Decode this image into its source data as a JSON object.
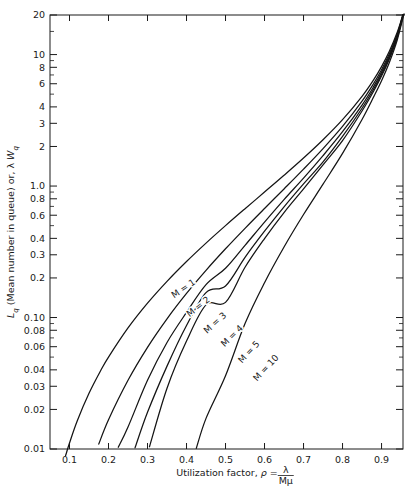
{
  "chart_data": {
    "type": "line",
    "title": "",
    "xlabel": "Utilization factor, ρ = λ/Mμ",
    "ylabel": "Lq (Mean number in queue) or, λ Wq",
    "xscale": "linear",
    "yscale": "log",
    "xlim": [
      0.05,
      0.955
    ],
    "ylim": [
      0.01,
      20
    ],
    "grid": false,
    "legend_position": "inline-curve-labels",
    "x_ticks": [
      0.1,
      0.2,
      0.3,
      0.4,
      0.5,
      0.6,
      0.7,
      0.8,
      0.9
    ],
    "x_tick_labels": [
      "0.1",
      "0.2",
      "0.3",
      "0.4",
      "0.5",
      "0.6",
      "0.7",
      "0.8",
      "0.9"
    ],
    "y_ticks": [
      0.01,
      0.02,
      0.03,
      0.04,
      0.06,
      0.08,
      0.1,
      0.2,
      0.3,
      0.4,
      0.6,
      0.8,
      1.0,
      2,
      3,
      4,
      6,
      8,
      10,
      20
    ],
    "y_tick_labels": [
      "0.01",
      "0.02",
      "0.03",
      "0.04",
      "0.06",
      "0.08",
      "0.10",
      "0.2",
      "0.3",
      "0.4",
      "0.6",
      "0.8",
      "1.0",
      "2",
      "3",
      "4",
      "6",
      "8",
      "10",
      "20"
    ],
    "series": [
      {
        "name": "M = 1",
        "label": "M = 1",
        "M": 1,
        "points": [
          [
            0.09,
            0.0089
          ],
          [
            0.1,
            0.0111
          ],
          [
            0.12,
            0.0164
          ],
          [
            0.15,
            0.0265
          ],
          [
            0.18,
            0.0395
          ],
          [
            0.2,
            0.05
          ],
          [
            0.25,
            0.0833
          ],
          [
            0.3,
            0.1286
          ],
          [
            0.35,
            0.1885
          ],
          [
            0.4,
            0.2667
          ],
          [
            0.45,
            0.3682
          ],
          [
            0.5,
            0.5
          ],
          [
            0.55,
            0.6722
          ],
          [
            0.6,
            0.9
          ],
          [
            0.65,
            1.2071
          ],
          [
            0.7,
            1.6333
          ],
          [
            0.75,
            2.25
          ],
          [
            0.8,
            3.2
          ],
          [
            0.85,
            4.8167
          ],
          [
            0.88,
            6.4533
          ],
          [
            0.9,
            8.1
          ],
          [
            0.92,
            10.58
          ],
          [
            0.94,
            14.72
          ],
          [
            0.9524,
            19.05
          ],
          [
            0.9545,
            20.0
          ]
        ]
      },
      {
        "name": "M = 2",
        "label": "M = 2",
        "M": 2,
        "points": [
          [
            0.175,
            0.0109
          ],
          [
            0.2,
            0.0167
          ],
          [
            0.25,
            0.0333
          ],
          [
            0.3,
            0.0593
          ],
          [
            0.35,
            0.0977
          ],
          [
            0.4,
            0.1524
          ],
          [
            0.45,
            0.2285
          ],
          [
            0.5,
            0.3333
          ],
          [
            0.55,
            0.4771
          ],
          [
            0.6,
            0.675
          ],
          [
            0.65,
            0.9506
          ],
          [
            0.7,
            1.3451
          ],
          [
            0.75,
            1.9286
          ],
          [
            0.8,
            2.8444
          ],
          [
            0.85,
            4.4262
          ],
          [
            0.88,
            6.0466
          ],
          [
            0.9,
            7.6737
          ],
          [
            0.92,
            10.13
          ],
          [
            0.94,
            14.25
          ],
          [
            0.952,
            18.61
          ],
          [
            0.9545,
            20.0
          ]
        ]
      },
      {
        "name": "M = 3",
        "label": "M = 3",
        "M": 3,
        "points": [
          [
            0.225,
            0.0103
          ],
          [
            0.25,
            0.0147
          ],
          [
            0.3,
            0.0333
          ],
          [
            0.35,
            0.0646
          ],
          [
            0.4,
            0.1094
          ],
          [
            0.45,
            0.1778
          ],
          [
            0.5,
            0.2368
          ],
          [
            0.55,
            0.3541
          ],
          [
            0.6,
            0.532
          ],
          [
            0.65,
            0.7888
          ],
          [
            0.7,
            1.1479
          ],
          [
            0.75,
            1.7036
          ],
          [
            0.8,
            2.5888
          ],
          [
            0.85,
            4.1332
          ],
          [
            0.88,
            5.7238
          ],
          [
            0.9,
            7.3541
          ],
          [
            0.92,
            9.7895
          ],
          [
            0.94,
            13.89
          ],
          [
            0.953,
            19.15
          ],
          [
            0.9555,
            20.0
          ]
        ]
      },
      {
        "name": "M = 4",
        "label": "M = 4",
        "M": 4,
        "points": [
          [
            0.268,
            0.0102
          ],
          [
            0.3,
            0.019
          ],
          [
            0.35,
            0.0427
          ],
          [
            0.4,
            0.087
          ],
          [
            0.45,
            0.1548
          ],
          [
            0.5,
            0.1739
          ],
          [
            0.55,
            0.287
          ],
          [
            0.6,
            0.4533
          ],
          [
            0.65,
            0.6954
          ],
          [
            0.7,
            1.0393
          ],
          [
            0.75,
            1.5281
          ],
          [
            0.8,
            2.3856
          ],
          [
            0.85,
            3.9076
          ],
          [
            0.88,
            5.4867
          ],
          [
            0.9,
            7.0898
          ],
          [
            0.92,
            9.5044
          ],
          [
            0.94,
            13.6
          ],
          [
            0.954,
            19.35
          ],
          [
            0.9565,
            20.0
          ]
        ]
      },
      {
        "name": "M = 5",
        "label": "M = 5",
        "M": 5,
        "points": [
          [
            0.305,
            0.0104
          ],
          [
            0.35,
            0.029
          ],
          [
            0.4,
            0.0662
          ],
          [
            0.45,
            0.1249
          ],
          [
            0.5,
            0.1304
          ],
          [
            0.55,
            0.2411
          ],
          [
            0.6,
            0.3988
          ],
          [
            0.65,
            0.6287
          ],
          [
            0.7,
            0.9506
          ],
          [
            0.75,
            1.4488
          ],
          [
            0.8,
            2.2164
          ],
          [
            0.85,
            3.7212
          ],
          [
            0.88,
            5.2875
          ],
          [
            0.9,
            6.8624
          ],
          [
            0.92,
            9.2555
          ],
          [
            0.94,
            13.38
          ],
          [
            0.955,
            19.53
          ],
          [
            0.957,
            20.0
          ]
        ]
      },
      {
        "name": "M = 10",
        "label": "M = 10",
        "M": 10,
        "points": [
          [
            0.425,
            0.0101
          ],
          [
            0.45,
            0.0171
          ],
          [
            0.5,
            0.0361
          ],
          [
            0.55,
            0.09
          ],
          [
            0.6,
            0.1841
          ],
          [
            0.65,
            0.344
          ],
          [
            0.7,
            0.6075
          ],
          [
            0.75,
            1.0335
          ],
          [
            0.8,
            1.7705
          ],
          [
            0.85,
            3.2117
          ],
          [
            0.88,
            4.7876
          ],
          [
            0.9,
            6.3315
          ],
          [
            0.92,
            8.7095
          ],
          [
            0.94,
            12.85
          ],
          [
            0.956,
            19.62
          ],
          [
            0.958,
            20.0
          ]
        ]
      }
    ],
    "curve_labels": [
      {
        "text": "M = 1",
        "x": 185,
        "y": 291,
        "rot": -34
      },
      {
        "text": "M = 2",
        "x": 200,
        "y": 309,
        "rot": -38
      },
      {
        "text": "M = 3",
        "x": 217,
        "y": 325,
        "rot": -42
      },
      {
        "text": "M = 4",
        "x": 234,
        "y": 338,
        "rot": -44
      },
      {
        "text": "M = 5",
        "x": 251,
        "y": 354,
        "rot": -47
      },
      {
        "text": "M = 10",
        "x": 268,
        "y": 370,
        "rot": -47
      }
    ]
  },
  "axes": {
    "y_label_parts": {
      "lq": "L",
      "lq_sub": "q",
      "mid": " (Mean number in queue) or, ",
      "lambda": "λ",
      "w": " W",
      "w_sub": "q"
    },
    "x_label_parts": {
      "lead": "Utilization factor, ",
      "rho": "ρ",
      "eq": " = ",
      "num": "λ",
      "den": "Mμ"
    }
  },
  "colors": {
    "background": "#ffffff",
    "axis": "#1a1a1a",
    "curve": "#141414",
    "text": "#1a1a1a"
  }
}
